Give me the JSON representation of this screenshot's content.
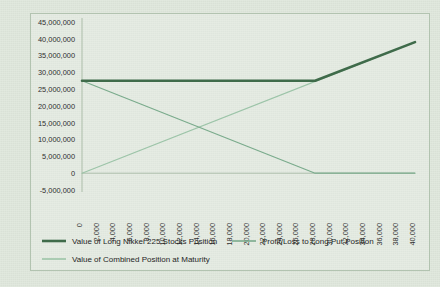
{
  "chart_data": {
    "type": "line",
    "title": "",
    "xlabel": "",
    "ylabel": "",
    "xlim": [
      0,
      40000
    ],
    "ylim": [
      -5000000,
      45000000
    ],
    "grid": false,
    "legend_position": "bottom",
    "x_ticks": [
      "0",
      "2,000",
      "4,000",
      "6,000",
      "8,000",
      "10,000",
      "12,000",
      "14,000",
      "16,000",
      "18,000",
      "20,000",
      "22,000",
      "24,000",
      "26,000",
      "28,000",
      "30,000",
      "32,000",
      "34,000",
      "36,000",
      "38,000",
      "40,000"
    ],
    "x_tick_values": [
      0,
      2000,
      4000,
      6000,
      8000,
      10000,
      12000,
      14000,
      16000,
      18000,
      20000,
      22000,
      24000,
      26000,
      28000,
      30000,
      32000,
      34000,
      36000,
      38000,
      40000
    ],
    "y_ticks": [
      "45,000,000",
      "40,000,000",
      "35,000,000",
      "30,000,000",
      "25,000,000",
      "20,000,000",
      "15,000,000",
      "10,000,000",
      "5,000,000",
      "0",
      "-5,000,000"
    ],
    "y_tick_values": [
      45000000,
      40000000,
      35000000,
      30000000,
      25000000,
      20000000,
      15000000,
      10000000,
      5000000,
      0,
      -5000000
    ],
    "series": [
      {
        "name": "Value of Long Nikkei 225 Stocks Position",
        "color": "#3f6b4a",
        "width": 2.6,
        "x": [
          0,
          28000,
          40000
        ],
        "y": [
          27500000,
          27500000,
          39000000
        ]
      },
      {
        "name": "Profit/Loss to Long Put Position",
        "color": "#7aab8c",
        "width": 1.2,
        "x": [
          0,
          28000,
          40000
        ],
        "y": [
          27500000,
          0,
          0
        ]
      },
      {
        "name": "Value of Combined Position at Maturity",
        "color": "#9cc4a8",
        "width": 1.2,
        "x": [
          0,
          40000
        ],
        "y": [
          0,
          39000000
        ]
      }
    ]
  },
  "legend": {
    "items": [
      {
        "label": "Value of Long Nikkei 225 Stocks Position",
        "color": "#3f6b4a",
        "width": 2.6
      },
      {
        "label": "Profit/Loss to Long Put Position",
        "color": "#7aab8c",
        "width": 1.6
      },
      {
        "label": "Value of Combined Position at Maturity",
        "color": "#9cc4a8",
        "width": 1.6
      }
    ]
  },
  "colors": {
    "background": "#dfe7dc",
    "frame": "#b2c3b0",
    "axis": "#9fb39d",
    "text": "#2f2f2f",
    "series_dark": "#3f6b4a",
    "series_mid": "#7aab8c",
    "series_light": "#9cc4a8"
  }
}
